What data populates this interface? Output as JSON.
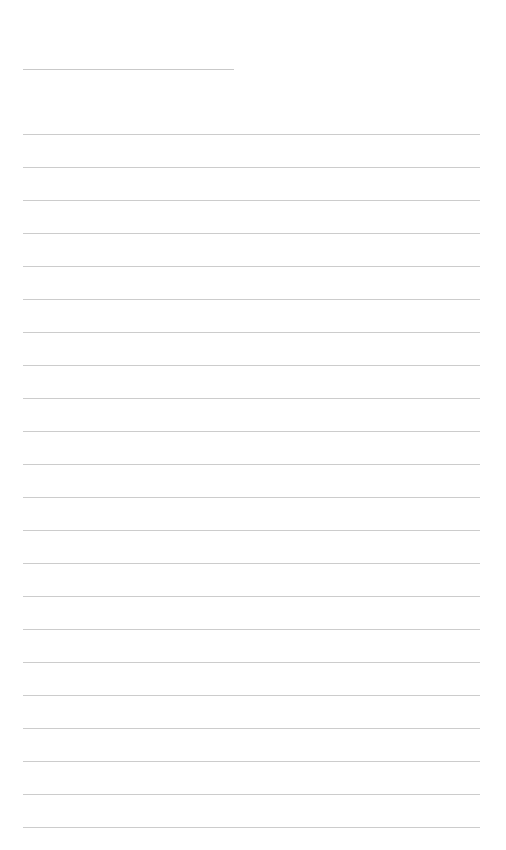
{
  "document": {
    "type": "lined-paper",
    "header_line": {
      "present": true
    },
    "ruled_lines": {
      "count": 22,
      "text": [
        "",
        "",
        "",
        "",
        "",
        "",
        "",
        "",
        "",
        "",
        "",
        "",
        "",
        "",
        "",
        "",
        "",
        "",
        "",
        "",
        "",
        ""
      ]
    },
    "line_color": "#cccccc",
    "background_color": "#ffffff"
  }
}
